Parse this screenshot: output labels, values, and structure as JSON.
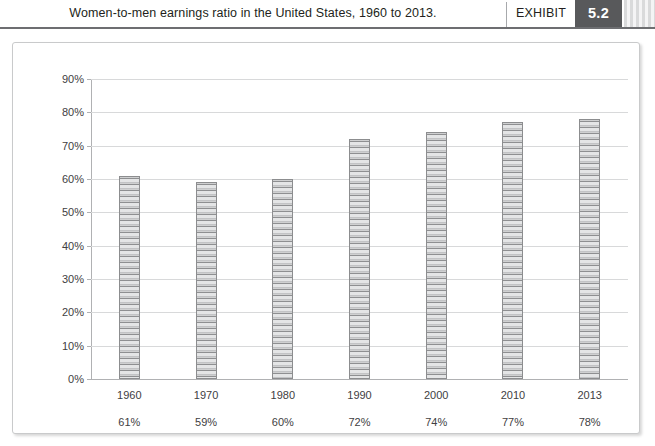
{
  "header": {
    "title": "Women-to-men earnings ratio in the United States, 1960 to 2013.",
    "exhibit_label": "EXHIBIT",
    "exhibit_number": "5.2"
  },
  "colors": {
    "header_rule": "#6d6e71",
    "exhibit_badge_bg": "#58595b",
    "exhibit_badge_text": "#ffffff",
    "frame_border": "#c9cacb",
    "gridline": "#d8d9da",
    "axis": "#b0b1b3",
    "bar_outline": "#8c8d8f",
    "bar_fill": "#d4d5d6",
    "text": "#231f20"
  },
  "chart_data": {
    "type": "bar",
    "title": "Women-to-men earnings ratio in the United States, 1960 to 2013.",
    "xlabel": "",
    "ylabel": "",
    "categories": [
      "1960",
      "1970",
      "1980",
      "1990",
      "2000",
      "2010",
      "2013"
    ],
    "values": [
      61,
      59,
      60,
      72,
      74,
      77,
      78
    ],
    "value_labels": [
      "61%",
      "59%",
      "60%",
      "72%",
      "74%",
      "77%",
      "78%"
    ],
    "ylim": [
      0,
      90
    ],
    "ytick_values": [
      0,
      10,
      20,
      30,
      40,
      50,
      60,
      70,
      80,
      90
    ],
    "ytick_labels": [
      "0%",
      "10%",
      "20%",
      "30%",
      "40%",
      "50%",
      "60%",
      "70%",
      "80%",
      "90%"
    ],
    "grid": true,
    "legend": false
  }
}
